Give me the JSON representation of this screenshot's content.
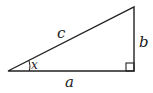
{
  "diagram": {
    "type": "right-triangle",
    "labels": {
      "hypotenuse": "c",
      "opposite": "b",
      "adjacent": "a",
      "angle": "x"
    },
    "colors": {
      "stroke": "#222222",
      "background": "#ffffff"
    }
  }
}
